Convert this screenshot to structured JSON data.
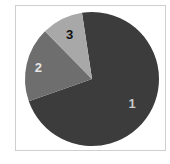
{
  "chart_data": {
    "type": "pie",
    "title": "",
    "categories": [
      "1",
      "2",
      "3"
    ],
    "values": [
      72,
      18,
      10
    ],
    "start_angle_deg": -8.6,
    "direction": "clockwise",
    "colors": [
      "#3c3c3c",
      "#6e6e6e",
      "#a8a8a8"
    ],
    "labels": [
      {
        "text": "1",
        "color": "#c8c8c8"
      },
      {
        "text": "2",
        "color": "#e6e6e6"
      },
      {
        "text": "3",
        "color": "#111111"
      }
    ],
    "legend": "none",
    "frame": true
  },
  "theme": {
    "background": "#ffffff",
    "frame_border": "#cfcfcf"
  }
}
